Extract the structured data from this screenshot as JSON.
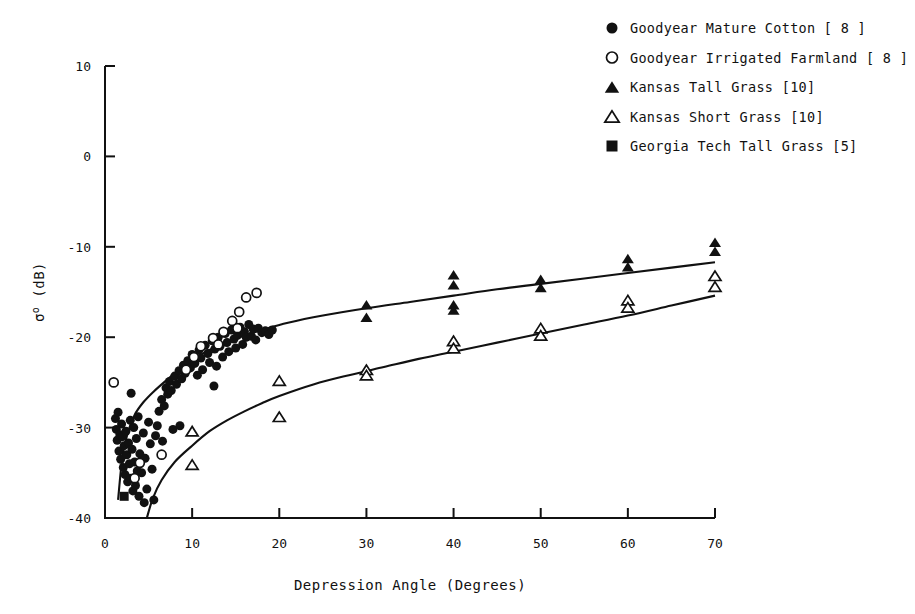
{
  "figure": {
    "background": "#ffffff",
    "ink_color": "#111111"
  },
  "chart_data": {
    "type": "scatter",
    "title": "",
    "xlabel": "Depression Angle (Degrees)",
    "ylabel": "σ° (dB)",
    "ylabel_parts": {
      "symbol": "σ",
      "superscript": "o",
      "units": "(dB)"
    },
    "xlim": [
      0,
      70
    ],
    "ylim": [
      -40,
      10
    ],
    "xticks": [
      0,
      10,
      20,
      30,
      40,
      50,
      60,
      70
    ],
    "xtick_labels": [
      "0",
      "10",
      "20",
      "30",
      "40",
      "50",
      "60",
      "70"
    ],
    "yticks": [
      10,
      0,
      -10,
      -20,
      -30,
      -40
    ],
    "ytick_labels": [
      "10",
      "0",
      "-10",
      "-20",
      "-30",
      "-40"
    ],
    "grid": false,
    "legend_position": "top-right",
    "series": [
      {
        "name": "Goodyear Mature Cotton [8]",
        "label": "Goodyear Mature Cotton",
        "reference": "[ 8 ]",
        "marker": "filled-circle",
        "marker_size": 9,
        "color": "#111111",
        "points": [
          [
            1.2,
            -29.0
          ],
          [
            1.3,
            -30.2
          ],
          [
            1.4,
            -31.4
          ],
          [
            1.5,
            -28.3
          ],
          [
            1.6,
            -32.6
          ],
          [
            1.7,
            -30.8
          ],
          [
            1.8,
            -33.5
          ],
          [
            1.9,
            -29.6
          ],
          [
            2.0,
            -31.0
          ],
          [
            2.1,
            -34.4
          ],
          [
            2.2,
            -32.0
          ],
          [
            2.3,
            -35.2
          ],
          [
            2.4,
            -30.4
          ],
          [
            2.5,
            -33.0
          ],
          [
            2.6,
            -36.0
          ],
          [
            2.7,
            -31.7
          ],
          [
            2.8,
            -34.0
          ],
          [
            2.9,
            -29.2
          ],
          [
            3.0,
            -35.6
          ],
          [
            3.1,
            -32.4
          ],
          [
            3.2,
            -37.0
          ],
          [
            3.3,
            -30.0
          ],
          [
            3.4,
            -33.8
          ],
          [
            3.5,
            -36.4
          ],
          [
            3.6,
            -31.2
          ],
          [
            3.7,
            -34.8
          ],
          [
            3.8,
            -28.8
          ],
          [
            3.9,
            -37.6
          ],
          [
            4.0,
            -32.9
          ],
          [
            4.2,
            -35.0
          ],
          [
            4.4,
            -30.6
          ],
          [
            4.6,
            -33.4
          ],
          [
            4.8,
            -36.8
          ],
          [
            5.0,
            -29.4
          ],
          [
            5.2,
            -31.8
          ],
          [
            5.4,
            -34.6
          ],
          [
            5.6,
            -38.0
          ],
          [
            5.8,
            -30.9
          ],
          [
            6.0,
            -29.8
          ],
          [
            6.2,
            -28.2
          ],
          [
            6.5,
            -26.9
          ],
          [
            6.8,
            -27.6
          ],
          [
            7.0,
            -25.6
          ],
          [
            7.2,
            -26.3
          ],
          [
            7.4,
            -24.9
          ],
          [
            7.6,
            -25.9
          ],
          [
            7.8,
            -30.2
          ],
          [
            8.0,
            -24.3
          ],
          [
            8.2,
            -25.2
          ],
          [
            8.5,
            -23.7
          ],
          [
            8.8,
            -24.6
          ],
          [
            9.0,
            -23.1
          ],
          [
            9.2,
            -24.0
          ],
          [
            9.5,
            -22.6
          ],
          [
            9.8,
            -23.4
          ],
          [
            10.0,
            -21.9
          ],
          [
            10.3,
            -22.9
          ],
          [
            10.6,
            -24.2
          ],
          [
            10.8,
            -21.4
          ],
          [
            11.0,
            -22.3
          ],
          [
            11.2,
            -23.6
          ],
          [
            11.5,
            -20.9
          ],
          [
            11.8,
            -21.8
          ],
          [
            12.0,
            -22.8
          ],
          [
            12.3,
            -20.4
          ],
          [
            12.6,
            -21.3
          ],
          [
            12.8,
            -23.2
          ],
          [
            13.0,
            -20.0
          ],
          [
            13.2,
            -21.0
          ],
          [
            13.5,
            -22.2
          ],
          [
            13.8,
            -19.6
          ],
          [
            14.0,
            -20.6
          ],
          [
            14.2,
            -21.6
          ],
          [
            14.5,
            -19.2
          ],
          [
            14.8,
            -20.2
          ],
          [
            15.0,
            -21.2
          ],
          [
            15.2,
            -19.8
          ],
          [
            15.5,
            -18.9
          ],
          [
            15.8,
            -20.8
          ],
          [
            16.0,
            -19.4
          ],
          [
            16.2,
            -20.0
          ],
          [
            16.5,
            -18.6
          ],
          [
            16.8,
            -19.9
          ],
          [
            17.0,
            -19.1
          ],
          [
            17.3,
            -20.3
          ],
          [
            17.6,
            -19.0
          ],
          [
            18.0,
            -19.5
          ],
          [
            18.4,
            -19.3
          ],
          [
            18.8,
            -19.7
          ],
          [
            19.2,
            -19.2
          ],
          [
            12.5,
            -25.4
          ],
          [
            8.6,
            -29.8
          ],
          [
            6.6,
            -31.5
          ],
          [
            4.5,
            -38.3
          ],
          [
            3.0,
            -26.2
          ]
        ]
      },
      {
        "name": "Goodyear Irrigated Farmland [8]",
        "label": "Goodyear Irrigated Farmland",
        "reference": "[ 8 ]",
        "marker": "open-circle",
        "marker_size": 9,
        "color": "#111111",
        "points": [
          [
            1.0,
            -25.0
          ],
          [
            3.4,
            -35.6
          ],
          [
            4.0,
            -33.9
          ],
          [
            6.5,
            -33.0
          ],
          [
            9.3,
            -23.6
          ],
          [
            10.2,
            -22.2
          ],
          [
            11.0,
            -21.0
          ],
          [
            12.4,
            -20.1
          ],
          [
            13.6,
            -19.4
          ],
          [
            14.6,
            -18.2
          ],
          [
            15.4,
            -17.2
          ],
          [
            16.2,
            -15.6
          ],
          [
            17.4,
            -15.1
          ],
          [
            15.2,
            -19.0
          ],
          [
            13.0,
            -20.8
          ]
        ]
      },
      {
        "name": "Kansas Tall Grass [10]",
        "label": "Kansas Tall Grass",
        "reference": "[10]",
        "marker": "filled-triangle",
        "marker_size": 10,
        "color": "#111111",
        "points": [
          [
            30.0,
            -16.4
          ],
          [
            30.0,
            -17.8
          ],
          [
            40.0,
            -13.1
          ],
          [
            40.0,
            -14.2
          ],
          [
            40.0,
            -16.4
          ],
          [
            40.0,
            -17.0
          ],
          [
            50.0,
            -13.6
          ],
          [
            50.0,
            -14.5
          ],
          [
            60.0,
            -11.3
          ],
          [
            60.0,
            -12.2
          ],
          [
            70.0,
            -9.5
          ],
          [
            70.0,
            -10.5
          ]
        ]
      },
      {
        "name": "Kansas Short Grass [10]",
        "label": "Kansas Short Grass",
        "reference": "[10]",
        "marker": "open-triangle",
        "marker_size": 10,
        "color": "#111111",
        "points": [
          [
            10.0,
            -30.4
          ],
          [
            10.0,
            -34.1
          ],
          [
            20.0,
            -24.8
          ],
          [
            20.0,
            -28.8
          ],
          [
            30.0,
            -23.6
          ],
          [
            30.0,
            -24.2
          ],
          [
            40.0,
            -20.4
          ],
          [
            40.0,
            -21.2
          ],
          [
            50.0,
            -19.0
          ],
          [
            50.0,
            -19.8
          ],
          [
            60.0,
            -15.9
          ],
          [
            60.0,
            -16.7
          ],
          [
            70.0,
            -13.2
          ],
          [
            70.0,
            -14.4
          ]
        ]
      },
      {
        "name": "Georgia Tech Tall Grass [5]",
        "label": "Georgia Tech Tall Grass",
        "reference": "[5]",
        "marker": "filled-square",
        "marker_size": 9,
        "color": "#111111",
        "points": [
          [
            2.2,
            -37.6
          ]
        ]
      }
    ],
    "fit_curves": [
      {
        "name": "upper-fit-tall-grass",
        "description": "Upper trend curve through mature cotton and tall grass data",
        "points": [
          [
            1.5,
            -38.0
          ],
          [
            2.0,
            -33.2
          ],
          [
            2.6,
            -30.6
          ],
          [
            3.4,
            -28.6
          ],
          [
            4.4,
            -27.2
          ],
          [
            5.6,
            -26.0
          ],
          [
            7.0,
            -24.8
          ],
          [
            8.5,
            -23.6
          ],
          [
            10.0,
            -22.5
          ],
          [
            12.0,
            -21.4
          ],
          [
            14.0,
            -20.5
          ],
          [
            16.0,
            -19.8
          ],
          [
            18.0,
            -19.2
          ],
          [
            21.0,
            -18.4
          ],
          [
            25.0,
            -17.6
          ],
          [
            30.0,
            -16.8
          ],
          [
            35.0,
            -16.1
          ],
          [
            40.0,
            -15.4
          ],
          [
            45.0,
            -14.7
          ],
          [
            50.0,
            -14.1
          ],
          [
            55.0,
            -13.5
          ],
          [
            60.0,
            -12.9
          ],
          [
            65.0,
            -12.3
          ],
          [
            70.0,
            -11.7
          ]
        ]
      },
      {
        "name": "lower-fit-short-grass",
        "description": "Lower trend curve through short grass data",
        "points": [
          [
            4.8,
            -40.0
          ],
          [
            5.5,
            -37.8
          ],
          [
            6.5,
            -35.8
          ],
          [
            8.0,
            -33.8
          ],
          [
            10.0,
            -32.0
          ],
          [
            12.0,
            -30.4
          ],
          [
            14.0,
            -29.2
          ],
          [
            16.0,
            -28.2
          ],
          [
            18.0,
            -27.3
          ],
          [
            20.0,
            -26.5
          ],
          [
            24.0,
            -25.2
          ],
          [
            28.0,
            -24.2
          ],
          [
            32.0,
            -23.3
          ],
          [
            36.0,
            -22.4
          ],
          [
            40.0,
            -21.6
          ],
          [
            45.0,
            -20.6
          ],
          [
            50.0,
            -19.6
          ],
          [
            55.0,
            -18.6
          ],
          [
            60.0,
            -17.6
          ],
          [
            65.0,
            -16.5
          ],
          [
            70.0,
            -15.4
          ]
        ]
      }
    ]
  },
  "legend": {
    "entries": [
      {
        "marker": "filled-circle",
        "text": "Goodyear Mature Cotton [ 8 ]"
      },
      {
        "marker": "open-circle",
        "text": "Goodyear Irrigated Farmland [ 8 ]"
      },
      {
        "marker": "filled-triangle",
        "text": "Kansas Tall Grass [10]"
      },
      {
        "marker": "open-triangle",
        "text": "Kansas Short Grass [10]"
      },
      {
        "marker": "filled-square",
        "text": "Georgia Tech Tall Grass [5]"
      }
    ]
  }
}
